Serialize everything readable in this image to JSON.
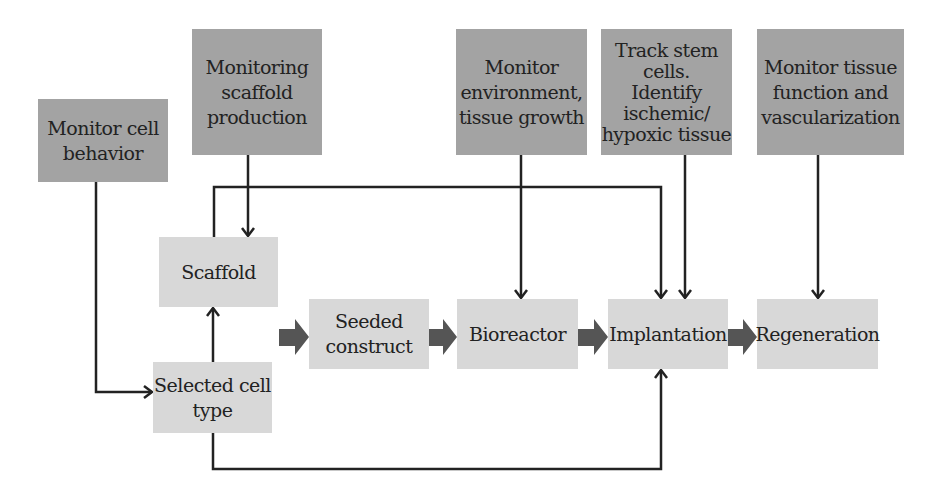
{
  "monitors": [
    {
      "id": "cell-behavior",
      "label": "Monitor cell\nbehavior"
    },
    {
      "id": "scaffold-production",
      "label": "Monitoring\nscaffold\nproduction"
    },
    {
      "id": "environment",
      "label": "Monitor\nenvironment,\ntissue growth"
    },
    {
      "id": "stem-cells",
      "label": "Track stem\ncells.\nIdentify\nischemic/\nhypoxic tissue"
    },
    {
      "id": "tissue-function",
      "label": "Monitor tissue\nfunction and\nvascularization"
    }
  ],
  "stages": [
    {
      "id": "scaffold",
      "label": "Scaffold"
    },
    {
      "id": "selected-cell",
      "label": "Selected cell\ntype"
    },
    {
      "id": "seeded",
      "label": "Seeded\nconstruct"
    },
    {
      "id": "bioreactor",
      "label": "Bioreactor"
    },
    {
      "id": "implantation",
      "label": "Implantation"
    },
    {
      "id": "regeneration",
      "label": "Regeneration"
    }
  ],
  "colors": {
    "monitor_box": "#a3a3a3",
    "stage_box": "#d8d8d8",
    "line": "#222222",
    "block_arrow": "#555555"
  }
}
